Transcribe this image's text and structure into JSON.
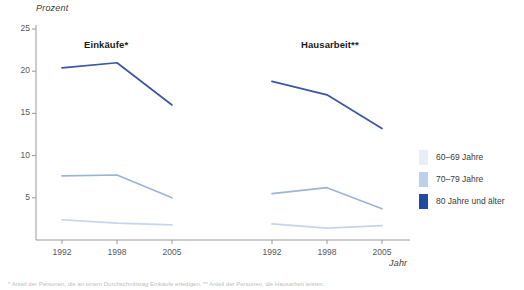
{
  "chart_data": {
    "type": "line",
    "title": "",
    "ylabel": "Prozent",
    "xlabel": "Jahr",
    "ylim": [
      0,
      25
    ],
    "yticks": [
      5,
      10,
      15,
      20,
      25
    ],
    "ytick_labels": [
      "5",
      "10",
      "15",
      "20",
      "25"
    ],
    "categories": [
      "1992",
      "1998",
      "2005"
    ],
    "grid": false,
    "legend_position": "right",
    "panels": [
      {
        "title": "Einkäufe*",
        "series": [
          {
            "name": "60–69 Jahre",
            "color": "#c7d4ea",
            "values": [
              2.4,
              2.0,
              1.8
            ]
          },
          {
            "name": "70–79 Jahre",
            "color": "#9db4da",
            "values": [
              7.6,
              7.7,
              5.0
            ]
          },
          {
            "name": "80 Jahre und älter",
            "color": "#3a56a4",
            "values": [
              20.4,
              21.0,
              16.0
            ]
          }
        ]
      },
      {
        "title": "Hausarbeit**",
        "series": [
          {
            "name": "60–69 Jahre",
            "color": "#c7d4ea",
            "values": [
              1.9,
              1.4,
              1.7
            ]
          },
          {
            "name": "70–79 Jahre",
            "color": "#9db4da",
            "values": [
              5.5,
              6.2,
              3.7
            ]
          },
          {
            "name": "80 Jahre und älter",
            "color": "#3a56a4",
            "values": [
              18.8,
              17.2,
              13.2
            ]
          }
        ]
      }
    ],
    "legend": [
      {
        "label": "60–69 Jahre",
        "color": "#e8eef8"
      },
      {
        "label": "70–79 Jahre",
        "color": "#bcd0ea"
      },
      {
        "label": "80 Jahre und älter",
        "color": "#1f4ba0"
      }
    ]
  },
  "footnote": {
    "text": "* Anteil der Personen, die an einem Durchschnittstag Einkäufe erledigen. ** Anteil der Personen, die Hausarbeit leisten."
  },
  "colors": {
    "axis": "#9a9a9a",
    "text": "#3c3c3c",
    "title": "#1a1a1a"
  }
}
